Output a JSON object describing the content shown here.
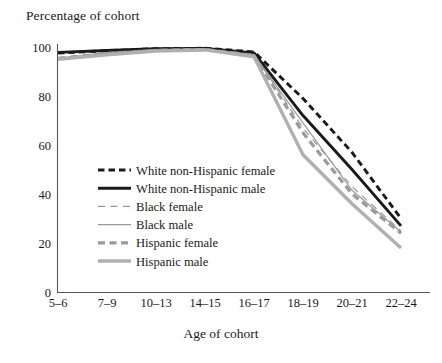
{
  "chart_data": {
    "type": "line",
    "title": "",
    "ylabel": "Percentage of cohort",
    "xlabel": "Age of cohort",
    "categories": [
      "5–6",
      "7–9",
      "10–13",
      "14–15",
      "16–17",
      "18–19",
      "20–21",
      "22–24"
    ],
    "ylim": [
      0,
      100
    ],
    "yticks": [
      "0",
      "20",
      "40",
      "60",
      "80",
      "100"
    ],
    "ytick_values": [
      0,
      20,
      40,
      60,
      80,
      100
    ],
    "grid": false,
    "legend_position": "center-left",
    "series": [
      {
        "name": "White non-Hispanic female",
        "color": "#1a1a1a",
        "style": "dashed",
        "width": 2.9,
        "values": [
          97.5,
          98.5,
          99.3,
          99.5,
          98.0,
          79.0,
          57.0,
          30.0
        ]
      },
      {
        "name": "White non-Hispanic male",
        "color": "#1a1a1a",
        "style": "solid",
        "width": 2.9,
        "values": [
          97.8,
          98.6,
          99.3,
          99.4,
          97.6,
          72.0,
          50.0,
          27.0
        ]
      },
      {
        "name": "Black female",
        "color": "#9a9a9a",
        "style": "dashed",
        "width": 1.2,
        "values": [
          95.8,
          97.8,
          99.0,
          99.3,
          97.0,
          67.0,
          43.0,
          25.0
        ]
      },
      {
        "name": "Black male",
        "color": "#9a9a9a",
        "style": "solid",
        "width": 1.2,
        "values": [
          95.5,
          97.6,
          98.9,
          99.2,
          96.8,
          69.0,
          41.5,
          24.5
        ]
      },
      {
        "name": "Hispanic female",
        "color": "#9a9a9a",
        "style": "dashed",
        "width": 3.2,
        "values": [
          95.2,
          97.2,
          98.6,
          99.0,
          96.5,
          65.0,
          40.0,
          24.0
        ]
      },
      {
        "name": "Hispanic male",
        "color": "#b0b0b0",
        "style": "solid",
        "width": 3.4,
        "values": [
          95.0,
          96.8,
          98.3,
          98.8,
          96.0,
          56.0,
          36.0,
          18.0
        ]
      }
    ]
  },
  "legend": {
    "items": [
      "White non-Hispanic female",
      "White non-Hispanic male",
      "Black female",
      "Black male",
      "Hispanic female",
      "Hispanic male"
    ]
  }
}
